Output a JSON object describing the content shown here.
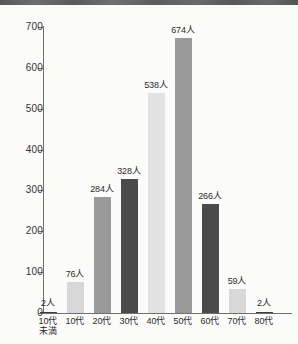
{
  "chart_data": {
    "type": "bar",
    "title": "",
    "subtitle": "",
    "xlabel": "",
    "ylabel": "",
    "categories": [
      "10代未満",
      "10代",
      "20代",
      "30代",
      "40代",
      "50代",
      "60代",
      "70代",
      "80代"
    ],
    "category_lines": [
      [
        "10代",
        "未満"
      ],
      [
        "10代",
        ""
      ],
      [
        "20代",
        ""
      ],
      [
        "30代",
        ""
      ],
      [
        "40代",
        ""
      ],
      [
        "50代",
        ""
      ],
      [
        "60代",
        ""
      ],
      [
        "70代",
        ""
      ],
      [
        "80代",
        ""
      ]
    ],
    "values": [
      2,
      76,
      284,
      328,
      538,
      674,
      266,
      59,
      2
    ],
    "value_labels": [
      "2人",
      "76人",
      "284人",
      "328人",
      "538人",
      "674人",
      "266人",
      "59人",
      "2人"
    ],
    "unit": "人",
    "ylim": [
      0,
      700
    ],
    "yticks": [
      0,
      100,
      200,
      300,
      400,
      500,
      600,
      700
    ],
    "ytick_labels": [
      "0",
      "100",
      "200",
      "300",
      "400",
      "500",
      "600",
      "700"
    ],
    "grid": false,
    "legend": "none",
    "bar_colors": [
      "#3d3d3d",
      "#d8d8d8",
      "#9a9a9a",
      "#4a4a4a",
      "#e2e2e2",
      "#9a9a9a",
      "#4a4a4a",
      "#d8d8d8",
      "#3d3d3d"
    ],
    "axis_color": "#6f6f6f",
    "background_color": "#fbfbfa",
    "text_color": "#2b2b2b"
  }
}
